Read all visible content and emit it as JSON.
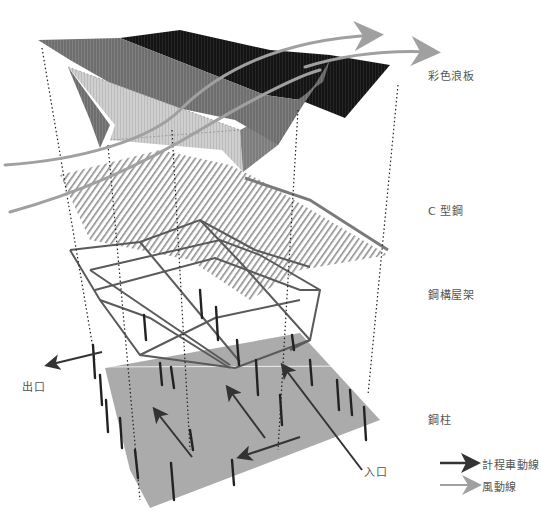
{
  "layers": [
    {
      "id": "roof",
      "label": "彩色浪板",
      "x": 428,
      "y": 74
    },
    {
      "id": "purlins",
      "label": "C 型鋼",
      "x": 428,
      "y": 209
    },
    {
      "id": "truss",
      "label": "鋼構屋架",
      "x": 428,
      "y": 293
    },
    {
      "id": "columns",
      "label": "鋼柱",
      "x": 428,
      "y": 418
    }
  ],
  "annotations": {
    "exit": {
      "label": "出口",
      "x": 24,
      "y": 384
    },
    "entrance": {
      "label": "入口",
      "x": 366,
      "y": 468
    }
  },
  "legend": [
    {
      "label": "計程車動線",
      "color": "#333333",
      "x": 440,
      "y": 463
    },
    {
      "label": "風動線",
      "color": "#999999",
      "x": 440,
      "y": 485
    }
  ],
  "colors": {
    "roof_dark": "#111111",
    "roof_mid": "#6a6a6a",
    "roof_light": "#c8c8c8",
    "purlin": "#8a8a8a",
    "truss": "#555555",
    "ground": "#a9a9a9",
    "column": "#222222",
    "taxi_arrow": "#333333",
    "wind_arrow": "#a0a0a0"
  }
}
